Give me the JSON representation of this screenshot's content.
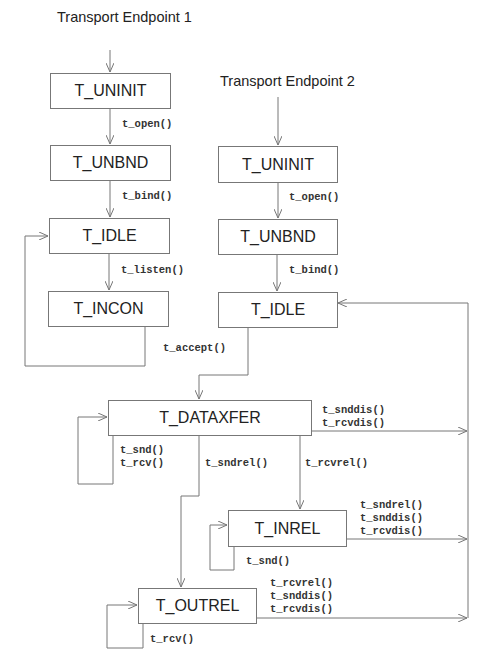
{
  "diagram": {
    "endpoint1": {
      "title": "Transport Endpoint 1",
      "states": {
        "uninit": "T_UNINIT",
        "unbnd": "T_UNBND",
        "idle": "T_IDLE",
        "incon": "T_INCON"
      },
      "transitions": {
        "open": "t_open()",
        "bind": "t_bind()",
        "listen": "t_listen()"
      }
    },
    "endpoint2": {
      "title": "Transport Endpoint 2",
      "states": {
        "uninit": "T_UNINIT",
        "unbnd": "T_UNBND",
        "idle": "T_IDLE"
      },
      "transitions": {
        "open": "t_open()",
        "bind": "t_bind()"
      }
    },
    "accept": "t_accept()",
    "shared_states": {
      "dataxfer": "T_DATAXFER",
      "inrel": "T_INREL",
      "outrel": "T_OUTREL"
    },
    "dataxfer_transitions": {
      "disconnect": [
        "t_snddis()",
        "t_rcvdis()"
      ],
      "self_loop": [
        "t_snd()",
        "t_rcv()"
      ],
      "sndrel": "t_sndrel()",
      "rcvrel": "t_rcvrel()"
    },
    "inrel_transitions": {
      "to_idle": [
        "t_sndrel()",
        "t_snddis()",
        "t_rcvdis()"
      ],
      "self_loop": "t_snd()"
    },
    "outrel_transitions": {
      "to_idle": [
        "t_rcvrel()",
        "t_snddis()",
        "t_rcvdis()"
      ],
      "self_loop": "t_rcv()"
    }
  }
}
